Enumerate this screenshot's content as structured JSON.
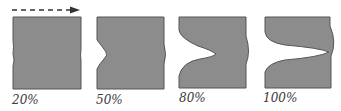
{
  "figure": {
    "arrow": {
      "direction": "right",
      "style": "dashed"
    },
    "colors": {
      "fill": "#8c8c8c",
      "stroke": "#5a5a5a",
      "arrow": "#333333"
    },
    "panels": [
      {
        "label": "20%"
      },
      {
        "label": "50%"
      },
      {
        "label": "80%"
      },
      {
        "label": "100%"
      }
    ]
  }
}
